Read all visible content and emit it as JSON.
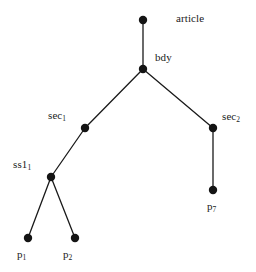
{
  "figure": {
    "kind": "tree-diagram",
    "width": 256,
    "height": 272,
    "background_color": "#ffffff",
    "edge_color": "#1a1a1a",
    "node_color": "#141414",
    "node_radius": 4.2,
    "edge_width": 1.3
  },
  "nodes": [
    {
      "id": "article",
      "label": "article",
      "label_main": "article",
      "label_sub": "",
      "x": 143,
      "y": 20,
      "label_x": 176,
      "label_y": 13
    },
    {
      "id": "bdy",
      "label": "bdy",
      "label_main": "bdy",
      "label_sub": "",
      "x": 143,
      "y": 69,
      "label_x": 155,
      "label_y": 52
    },
    {
      "id": "sec1",
      "label": "sec1",
      "label_main": "sec",
      "label_sub": "1",
      "x": 85,
      "y": 128,
      "label_x": 48,
      "label_y": 110
    },
    {
      "id": "sec2",
      "label": "sec2",
      "label_main": "sec",
      "label_sub": "2",
      "x": 213,
      "y": 128,
      "label_x": 222,
      "label_y": 111
    },
    {
      "id": "ss11",
      "label": "ss11",
      "label_main": "ss1",
      "label_sub": "1",
      "x": 51,
      "y": 177,
      "label_x": 13,
      "label_y": 159
    },
    {
      "id": "p1",
      "label": "p1",
      "label_main": "p",
      "label_sub": "1",
      "x": 28,
      "y": 238,
      "label_x": 17,
      "label_y": 249
    },
    {
      "id": "p2",
      "label": "p2",
      "label_main": "p",
      "label_sub": "2",
      "x": 75,
      "y": 238,
      "label_x": 63,
      "label_y": 249
    },
    {
      "id": "p7",
      "label": "p7",
      "label_main": "p",
      "label_sub": "7",
      "x": 213,
      "y": 190,
      "label_x": 207,
      "label_y": 201
    }
  ],
  "edges": [
    {
      "from": "article",
      "to": "bdy",
      "x1": 143,
      "y1": 20,
      "x2": 143,
      "y2": 69
    },
    {
      "from": "bdy",
      "to": "sec1",
      "x1": 143,
      "y1": 69,
      "x2": 85,
      "y2": 128
    },
    {
      "from": "bdy",
      "to": "sec2",
      "x1": 143,
      "y1": 69,
      "x2": 213,
      "y2": 128
    },
    {
      "from": "sec1",
      "to": "ss11",
      "x1": 85,
      "y1": 128,
      "x2": 51,
      "y2": 177
    },
    {
      "from": "ss11",
      "to": "p1",
      "x1": 51,
      "y1": 177,
      "x2": 28,
      "y2": 238
    },
    {
      "from": "ss11",
      "to": "p2",
      "x1": 51,
      "y1": 177,
      "x2": 75,
      "y2": 238
    },
    {
      "from": "sec2",
      "to": "p7",
      "x1": 213,
      "y1": 128,
      "x2": 213,
      "y2": 190
    }
  ]
}
